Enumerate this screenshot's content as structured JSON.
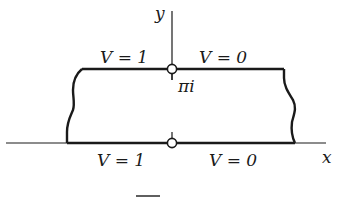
{
  "diagram": {
    "type": "strip-boundary-value-problem",
    "axes": {
      "x_label": "x",
      "y_label": "y"
    },
    "top_boundary": {
      "left_label": "V = 1",
      "right_label": "V = 0",
      "marker_label": "πi"
    },
    "bottom_boundary": {
      "left_label": "V = 1",
      "right_label": "V = 0"
    },
    "colors": {
      "line": "#1a1a1a",
      "background": "#ffffff"
    }
  }
}
